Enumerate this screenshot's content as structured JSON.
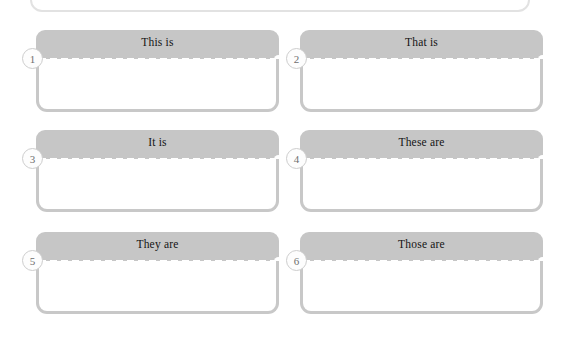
{
  "worksheet": {
    "top_panel": {
      "name": "cut-off-panel"
    },
    "cards": [
      {
        "number": "1",
        "label": "This is"
      },
      {
        "number": "2",
        "label": "That is"
      },
      {
        "number": "3",
        "label": "It is"
      },
      {
        "number": "4",
        "label": "These are"
      },
      {
        "number": "5",
        "label": "They are"
      },
      {
        "number": "6",
        "label": "Those are"
      }
    ],
    "colors": {
      "header_gray": "#c6c6c6",
      "border_gray": "#c8c8c8",
      "badge_border": "#cdcdcd",
      "badge_text": "#6e6e6e",
      "label_text": "#141414",
      "page_background": "#ffffff"
    },
    "layout": {
      "columns": 2,
      "rows": 3,
      "card_width": 243,
      "card_height": 82,
      "col_x": [
        36,
        300
      ],
      "row_y": [
        30,
        130,
        232
      ]
    }
  }
}
